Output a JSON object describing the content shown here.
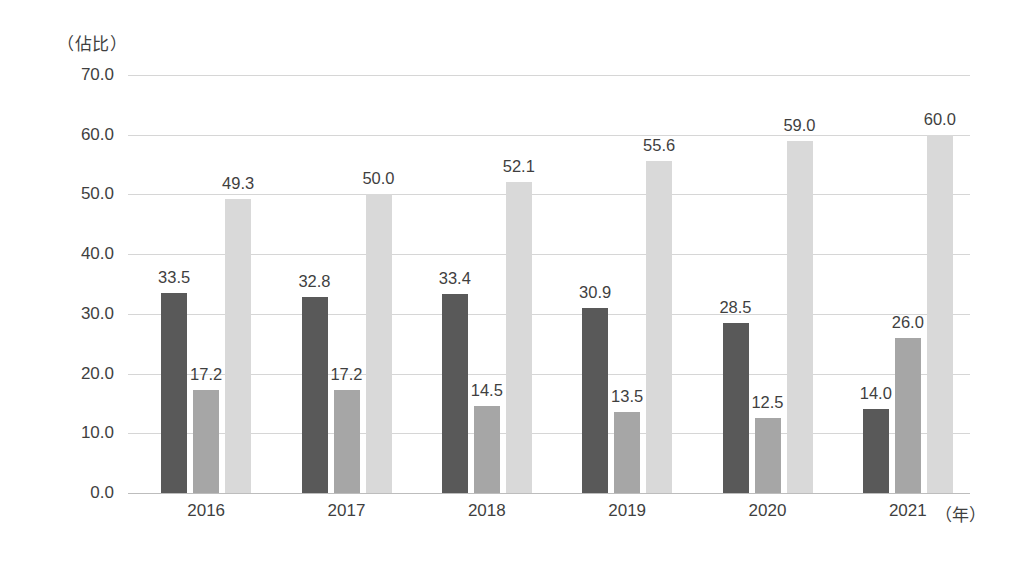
{
  "chart_data": {
    "type": "bar",
    "title": "",
    "subtitle": "",
    "ylabel": "（佔比）",
    "xlabel": "（年）",
    "categories": [
      "2016",
      "2017",
      "2018",
      "2019",
      "2020",
      "2021"
    ],
    "series": [
      {
        "name": "series-1",
        "color": "#595959",
        "values": [
          33.5,
          32.8,
          33.4,
          30.9,
          28.5,
          14.0
        ],
        "labels": [
          "33.5",
          "32.8",
          "33.4",
          "30.9",
          "28.5",
          "14.0"
        ]
      },
      {
        "name": "series-2",
        "color": "#a6a6a6",
        "values": [
          17.2,
          17.2,
          14.5,
          13.5,
          12.5,
          26.0
        ],
        "labels": [
          "17.2",
          "17.2",
          "14.5",
          "13.5",
          "12.5",
          "26.0"
        ]
      },
      {
        "name": "series-3",
        "color": "#d9d9d9",
        "values": [
          49.3,
          50.0,
          52.1,
          55.6,
          59.0,
          60.0
        ],
        "labels": [
          "49.3",
          "50.0",
          "52.1",
          "55.6",
          "59.0",
          "60.0"
        ]
      }
    ],
    "ylim": [
      0.0,
      70.0
    ],
    "ytick_values": [
      0.0,
      10.0,
      20.0,
      30.0,
      40.0,
      50.0,
      60.0,
      70.0
    ],
    "ytick_labels": [
      "0.0",
      "10.0",
      "20.0",
      "30.0",
      "40.0",
      "50.0",
      "60.0",
      "70.0"
    ],
    "grid": true,
    "legend": "none",
    "gridline_color": "#d6d6d6",
    "axis_color": "#bdbdbd",
    "background": "#ffffff",
    "text_color": "#3f3f3f"
  }
}
